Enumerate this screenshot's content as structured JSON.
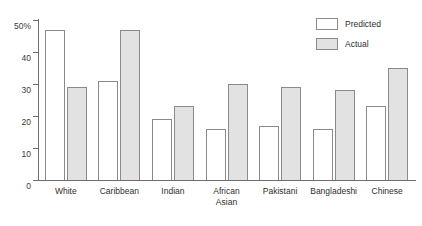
{
  "chart_data": {
    "type": "bar",
    "title": "",
    "xlabel": "",
    "ylabel": "",
    "ylim": [
      0,
      50
    ],
    "grid": false,
    "legend_position": "top-right",
    "y_ticks": [
      {
        "value": 50,
        "label": "50%"
      },
      {
        "value": 40,
        "label": "40"
      },
      {
        "value": 30,
        "label": "30"
      },
      {
        "value": 20,
        "label": "20"
      },
      {
        "value": 10,
        "label": "10"
      },
      {
        "value": 0,
        "label": "0"
      }
    ],
    "categories": [
      "White",
      "Caribbean",
      "Indian",
      "African\nAsian",
      "Pakistani",
      "Bangladeshi",
      "Chinese"
    ],
    "series": [
      {
        "name": "Predicted",
        "color": "#ffffff",
        "values": [
          47,
          31,
          19,
          16,
          17,
          16,
          23
        ]
      },
      {
        "name": "Actual",
        "color": "#e2e2e2",
        "values": [
          29,
          47,
          23,
          30,
          29,
          28,
          35
        ]
      }
    ]
  },
  "legend": {
    "items": [
      {
        "label": "Predicted"
      },
      {
        "label": "Actual"
      }
    ]
  }
}
